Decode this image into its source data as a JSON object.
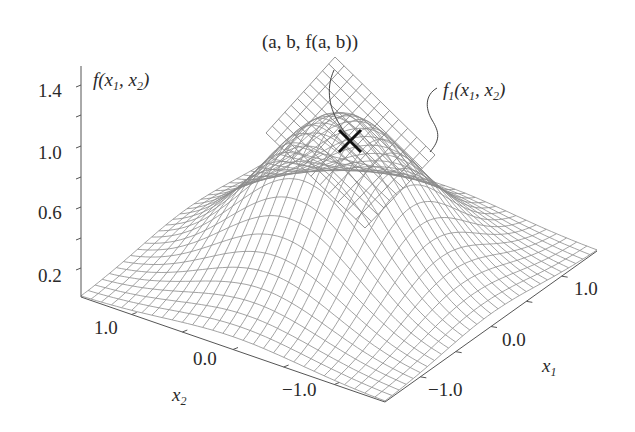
{
  "figure": {
    "title_point_label": "(a, b, f(a, b))",
    "surface_label": {
      "fn": "f",
      "sub": "1",
      "args": "(x",
      "arg1_sub": "1",
      "sep": ", x",
      "arg2_sub": "2",
      "close": ")"
    },
    "zaxis_label": {
      "fn": "f",
      "args": "(x",
      "arg1_sub": "1",
      "sep": ", x",
      "arg2_sub": "2",
      "close": ")"
    },
    "x1_label": {
      "var": "x",
      "sub": "1"
    },
    "x2_label": {
      "var": "x",
      "sub": "2"
    },
    "z_ticks": [
      "1.4",
      "1.0",
      "0.6",
      "0.2"
    ],
    "x1_ticks": [
      "1.0",
      "0.0",
      "−1.0"
    ],
    "x2_ticks": [
      "1.0",
      "0.0",
      "−1.0"
    ],
    "marker": "cross-icon",
    "colors": {
      "mesh": "#8c8c8c",
      "axis": "#555555",
      "marker": "#111111",
      "text": "#2a2a2a"
    }
  },
  "chart_data": {
    "type": "surface3d",
    "title": "",
    "zlabel": "f(x1, x2)",
    "xlabel": "x1",
    "ylabel": "x2",
    "z_ticks": [
      0.2,
      0.6,
      1.0,
      1.4
    ],
    "x1_ticks": [
      -1.0,
      0.0,
      1.0
    ],
    "x2_ticks": [
      -1.0,
      0.0,
      1.0
    ],
    "zlim": [
      0.0,
      1.5
    ],
    "x1lim": [
      -1.5,
      1.5
    ],
    "x2lim": [
      -1.5,
      1.5
    ],
    "peak_value": 1.0,
    "annotations": [
      "(a, b, f(a, b))",
      "f1(x1, x2)"
    ]
  }
}
